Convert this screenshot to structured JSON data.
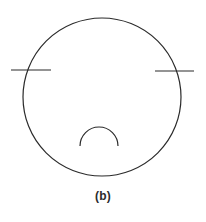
{
  "figure": {
    "caption": "(b)",
    "background_color": "#ffffff",
    "stroke_color": "#2b2b2b",
    "canvas": {
      "width": 206,
      "height": 222
    },
    "elements": {
      "main_circle": {
        "name": "main-circle",
        "cx": 102,
        "cy": 97,
        "r": 79,
        "stroke_width": 1.2
      },
      "left_tick_line": {
        "name": "left-chord-line",
        "x1": 11,
        "y1": 70,
        "x2": 51,
        "y2": 70,
        "stroke_width": 1.2
      },
      "right_tick_line": {
        "name": "right-chord-line",
        "x1": 155,
        "y1": 71,
        "x2": 194,
        "y2": 71,
        "stroke_width": 1.2
      },
      "bottom_arc": {
        "name": "bottom-dome-arc",
        "cx": 99,
        "cy": 146,
        "r": 19,
        "start_x": 80,
        "start_y": 146,
        "end_x": 118,
        "end_y": 146,
        "stroke_width": 1.2
      }
    }
  },
  "chart_data": {
    "type": "diagram",
    "title": "(b)",
    "shapes": [
      {
        "shape": "circle",
        "label": "main outline",
        "cx": 102,
        "cy": 97,
        "r": 79
      },
      {
        "shape": "line",
        "label": "left chord tick",
        "x1": 11,
        "y1": 70,
        "x2": 51,
        "y2": 70
      },
      {
        "shape": "line",
        "label": "right chord tick",
        "x1": 155,
        "y1": 71,
        "x2": 194,
        "y2": 71
      },
      {
        "shape": "arc",
        "label": "bottom dome",
        "cx": 99,
        "cy": 146,
        "r": 19,
        "sweep": "upper-half"
      }
    ]
  }
}
